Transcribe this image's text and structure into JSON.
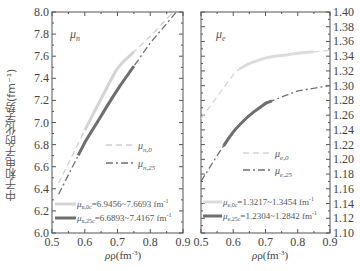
{
  "chart_data": [
    {
      "type": "line",
      "panel": "left",
      "panel_label": "μn",
      "xlabel": "ρ(fm⁻³)",
      "ylabel": "中子和电子的化学势(fm⁻¹)",
      "xlim": [
        0.5,
        0.9
      ],
      "ylim": [
        6.0,
        8.0
      ],
      "xticks": [
        "0.5",
        "0.6",
        "0.7",
        "0.8",
        "0.9"
      ],
      "yticks": [
        "6.0",
        "6.2",
        "6.4",
        "6.6",
        "6.8",
        "7.0",
        "7.2",
        "7.4",
        "7.6",
        "7.8",
        "8.0"
      ],
      "series": [
        {
          "name": "μn,0",
          "style": "dashed",
          "color": "#cfcfcf",
          "x": [
            0.52,
            0.6,
            0.7,
            0.8,
            0.87
          ],
          "y": [
            6.45,
            6.93,
            7.5,
            7.78,
            8.0
          ]
        },
        {
          "name": "μn,25",
          "style": "dash-dot",
          "color": "#707070",
          "x": [
            0.52,
            0.6,
            0.7,
            0.8,
            0.88
          ],
          "y": [
            6.35,
            6.82,
            7.3,
            7.72,
            8.0
          ]
        }
      ],
      "highlight_ranges": [
        {
          "name": "μn,0c",
          "range": "=6.9456~7.6693 fm⁻¹",
          "color": "#d4d4d4",
          "x": [
            0.6,
            0.75
          ],
          "y": [
            6.95,
            7.67
          ]
        },
        {
          "name": "μn,25c",
          "range": "=6.6893~7.4167 fm⁻¹",
          "color": "#6e6e6e",
          "x": [
            0.58,
            0.75
          ],
          "y": [
            6.69,
            7.42
          ]
        }
      ],
      "legend": [
        "μn,0",
        "μn,25"
      ],
      "grid": false
    },
    {
      "type": "line",
      "panel": "right",
      "panel_label": "μe",
      "xlabel": "ρ(fm⁻³)",
      "xlim": [
        0.5,
        0.9
      ],
      "ylim": [
        1.1,
        1.4
      ],
      "xticks": [
        "0.5",
        "0.6",
        "0.7",
        "0.8",
        "0.9"
      ],
      "yticks": [
        "1.10",
        "1.12",
        "1.14",
        "1.16",
        "1.18",
        "1.20",
        "1.22",
        "1.24",
        "1.26",
        "1.28",
        "1.30",
        "1.32",
        "1.34",
        "1.36",
        "1.38",
        "1.40"
      ],
      "series": [
        {
          "name": "μe,0",
          "style": "dashed",
          "color": "#d6d6d6",
          "x": [
            0.5,
            0.55,
            0.6,
            0.63,
            0.7,
            0.8,
            0.9
          ],
          "y": [
            1.255,
            1.285,
            1.315,
            1.327,
            1.338,
            1.344,
            1.348
          ]
        },
        {
          "name": "μe,25",
          "style": "dash-dot",
          "color": "#707070",
          "x": [
            0.5,
            0.55,
            0.6,
            0.65,
            0.7,
            0.8,
            0.9
          ],
          "y": [
            1.17,
            1.205,
            1.238,
            1.26,
            1.276,
            1.293,
            1.3
          ]
        }
      ],
      "highlight_ranges": [
        {
          "name": "μe,0c",
          "range": "=1.3217~1.3454 fm⁻¹",
          "color": "#dcdcdc",
          "x": [
            0.62,
            0.85
          ],
          "y": [
            1.322,
            1.345
          ]
        },
        {
          "name": "μe,25c",
          "range": "=1.2304~1.2842 fm⁻¹",
          "color": "#6e6e6e",
          "x": [
            0.57,
            0.72
          ],
          "y": [
            1.23,
            1.284
          ]
        }
      ],
      "legend": [
        "μe,0",
        "μe,25"
      ],
      "grid": false
    }
  ],
  "labels": {
    "ylabel": "中子和电子的化学势(fm⁻¹)",
    "left_panel": "μ",
    "left_panel_sub": "n",
    "right_panel": "μ",
    "right_panel_sub": "e",
    "xlabel_left": "ρ(fm",
    "xlabel_right": "ρ(fm",
    "xlabel_sup": "-3",
    "xlabel_close": ")",
    "legend_left_0": "μ",
    "legend_left_0_sub": "n,0",
    "legend_left_25": "μ",
    "legend_left_25_sub": "n,25",
    "legend_right_0": "μ",
    "legend_right_0_sub": "e,0",
    "legend_right_25": "μ",
    "legend_right_25_sub": "e,25",
    "range_left_0_sym": "μ",
    "range_left_0_sub": "n,0c",
    "range_left_0_text": "=6.9456~7.6693 fm",
    "range_left_25_sym": "μ",
    "range_left_25_sub": "n,25c",
    "range_left_25_text": "=6.6893~7.4167 fm",
    "range_right_0_sym": "μ",
    "range_right_0_sub": "e,0c",
    "range_right_0_text": "=1.3217~1.3454 fm",
    "range_right_25_sym": "μ",
    "range_right_25_sub": "e,25c",
    "range_right_25_text": "=1.2304~1.2842 fm",
    "unit_sup": "-1"
  },
  "left_yticks": [
    "8.0",
    "7.8",
    "7.6",
    "7.4",
    "7.2",
    "7.0",
    "6.8",
    "6.6",
    "6.4",
    "6.2",
    "6.0"
  ],
  "right_yticks": [
    "1.40",
    "1.38",
    "1.36",
    "1.34",
    "1.32",
    "1.30",
    "1.28",
    "1.26",
    "1.24",
    "1.22",
    "1.20",
    "1.18",
    "1.16",
    "1.14",
    "1.12",
    "1.10"
  ],
  "xticks": [
    "0.5",
    "0.6",
    "0.7",
    "0.8",
    "0.9"
  ]
}
